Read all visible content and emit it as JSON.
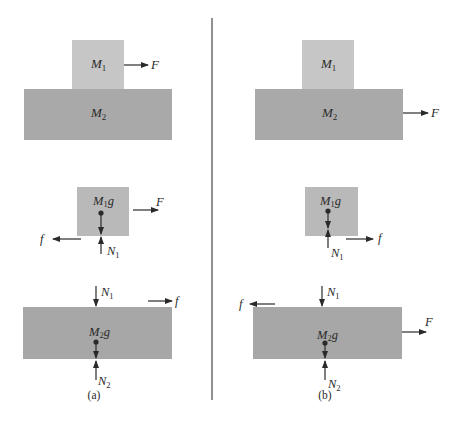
{
  "colors": {
    "block_m1": "#c6c6c6",
    "block_m2": "#a9a9a9",
    "fbd_m1": "#b9b9b9",
    "fbd_m2": "#a7a7a7",
    "ink": "#2a2a2a",
    "divider": "#555555"
  },
  "panels": [
    {
      "caption": "(a)",
      "setup": {
        "upper_block": {
          "label": "M",
          "sub": "1"
        },
        "lower_block": {
          "label": "M",
          "sub": "2"
        },
        "applied_force": {
          "label": "F",
          "acts_on": "M1",
          "direction": "right"
        }
      },
      "fbd_m1": {
        "weight": {
          "label": "M",
          "sub": "1",
          "suffix": "g"
        },
        "normal": {
          "label": "N",
          "sub": "1"
        },
        "applied": {
          "label": "F",
          "direction": "right"
        },
        "friction": {
          "label": "f",
          "direction": "left"
        }
      },
      "fbd_m2": {
        "weight": {
          "label": "M",
          "sub": "2",
          "suffix": "g"
        },
        "normal_top": {
          "label": "N",
          "sub": "1"
        },
        "normal_bottom": {
          "label": "N",
          "sub": "2"
        },
        "friction": {
          "label": "f",
          "direction": "right"
        }
      }
    },
    {
      "caption": "(b)",
      "setup": {
        "upper_block": {
          "label": "M",
          "sub": "1"
        },
        "lower_block": {
          "label": "M",
          "sub": "2"
        },
        "applied_force": {
          "label": "F",
          "acts_on": "M2",
          "direction": "right"
        }
      },
      "fbd_m1": {
        "weight": {
          "label": "M",
          "sub": "1",
          "suffix": "g"
        },
        "normal": {
          "label": "N",
          "sub": "1"
        },
        "friction": {
          "label": "f",
          "direction": "right"
        }
      },
      "fbd_m2": {
        "weight": {
          "label": "M",
          "sub": "2",
          "suffix": "g"
        },
        "normal_top": {
          "label": "N",
          "sub": "1"
        },
        "normal_bottom": {
          "label": "N",
          "sub": "2"
        },
        "applied": {
          "label": "F",
          "direction": "right"
        },
        "friction": {
          "label": "f",
          "direction": "left"
        }
      }
    }
  ]
}
